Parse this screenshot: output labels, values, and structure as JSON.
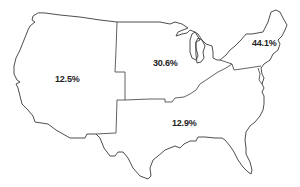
{
  "map": {
    "type": "choropleth-outline",
    "region": "United States (contiguous)",
    "line_color": "#3a3a3a",
    "background": "#ffffff"
  },
  "regions": [
    {
      "id": "west",
      "name": "West",
      "value": "12.5%"
    },
    {
      "id": "midwest",
      "name": "Midwest",
      "value": "30.6%"
    },
    {
      "id": "northeast",
      "name": "Northeast",
      "value": "44.1%"
    },
    {
      "id": "south",
      "name": "South",
      "value": "12.9%"
    }
  ]
}
